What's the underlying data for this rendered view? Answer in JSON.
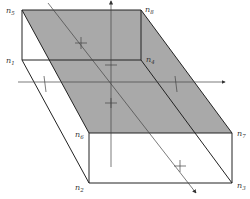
{
  "diagram": {
    "type": "hexahedron-with-intersecting-plane",
    "nodes": [
      {
        "id": "n1",
        "label": "n",
        "sub": "1",
        "x": 22,
        "y": 60
      },
      {
        "id": "n2",
        "label": "n",
        "sub": "2",
        "x": 89,
        "y": 183
      },
      {
        "id": "n3",
        "label": "n",
        "sub": "3",
        "x": 232,
        "y": 183
      },
      {
        "id": "n4",
        "label": "n",
        "sub": "4",
        "x": 141,
        "y": 60
      },
      {
        "id": "n5",
        "label": "n",
        "sub": "5",
        "x": 22,
        "y": 10
      },
      {
        "id": "n6",
        "label": "n",
        "sub": "6",
        "x": 89,
        "y": 133
      },
      {
        "id": "n7",
        "label": "n",
        "sub": "7",
        "x": 232,
        "y": 133
      },
      {
        "id": "n8",
        "label": "n",
        "sub": "8",
        "x": 141,
        "y": 10
      }
    ],
    "colors": {
      "shaded_plane": "#a9a9a9",
      "edge": "#222222",
      "axis": "#444444",
      "background": "#ffffff"
    },
    "shaded_face": [
      "n5",
      "n8",
      "n7",
      "n6"
    ]
  }
}
